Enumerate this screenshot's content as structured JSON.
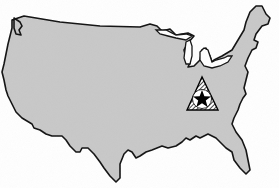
{
  "map": {
    "subject": "Continental United States outline map",
    "fill_color": "#c8c8c8",
    "outline_color": "#111111",
    "background_color": "#ffffff",
    "marker": {
      "type": "hatched-triangle-with-star",
      "location_description": "Ohio River valley region (Ohio/Kentucky/West Virginia)",
      "x": 201,
      "y": 96,
      "star_color": "#000000",
      "circle_color": "#ffffff"
    }
  }
}
